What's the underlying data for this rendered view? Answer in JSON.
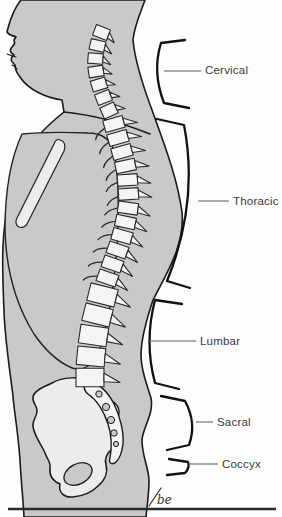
{
  "diagram": {
    "labels": {
      "cervical": "Cervical",
      "thoracic": "Thoracic",
      "lumbar": "Lumbar",
      "sacral": "Sacral",
      "coccyx": "Coccyx"
    },
    "signature": "be"
  },
  "colors": {
    "background": "#fdfdfd",
    "body_gray": "#c9c9c9",
    "bone_white": "#f4f4f4",
    "bone_shaded": "#ececec",
    "outline_black": "#1a1a1a",
    "label_text": "#3a3a3a",
    "leader_line": "#5a5a5a",
    "rule_line": "#2b2b2b"
  }
}
